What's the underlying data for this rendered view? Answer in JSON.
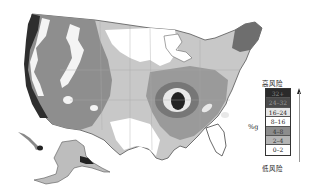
{
  "map": {
    "subject": "United States risk map",
    "regions_shown": [
      "contiguous-us",
      "alaska",
      "hawaii"
    ]
  },
  "legend": {
    "high_label": "高风险",
    "low_label": "低风险",
    "unit_label": "%g",
    "classes": [
      {
        "label": "32+",
        "color": "#2a2a2a",
        "text_color": "#888888"
      },
      {
        "label": "24–32",
        "color": "#4a4a4a",
        "text_color": "#9a9a9a"
      },
      {
        "label": "16–24",
        "color": "#e6e6e6",
        "text_color": "#222222"
      },
      {
        "label": "8–16",
        "color": "#ffffff",
        "text_color": "#222222"
      },
      {
        "label": "4–8",
        "color": "#8c8c8c",
        "text_color": "#333333"
      },
      {
        "label": "2–4",
        "color": "#b4b4b4",
        "text_color": "#333333"
      },
      {
        "label": "0–2",
        "color": "#ffffff",
        "text_color": "#222222"
      }
    ]
  }
}
